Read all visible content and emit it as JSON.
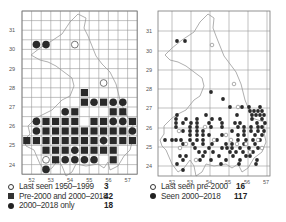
{
  "left_map": {
    "lat_labels": [
      "31",
      "30",
      "29",
      "28",
      "27",
      "26",
      "25",
      "24"
    ],
    "lon_labels": [
      "52",
      "53",
      "54",
      "55",
      "56",
      "57"
    ],
    "grid": {
      "x0": 22,
      "y0": 11,
      "cell": 9.6,
      "cols": 12,
      "rows": 17
    },
    "cells": {
      "square": [
        [
          6,
          8
        ],
        [
          6,
          9
        ],
        [
          8,
          9
        ],
        [
          5,
          10
        ],
        [
          9,
          10
        ],
        [
          10,
          10
        ],
        [
          2,
          11
        ],
        [
          3,
          11
        ],
        [
          4,
          11
        ],
        [
          5,
          11
        ],
        [
          7,
          11
        ],
        [
          8,
          11
        ],
        [
          11,
          11
        ],
        [
          2,
          12
        ],
        [
          3,
          12
        ],
        [
          4,
          12
        ],
        [
          5,
          12
        ],
        [
          6,
          12
        ],
        [
          7,
          12
        ],
        [
          8,
          12
        ],
        [
          9,
          12
        ],
        [
          10,
          12
        ],
        [
          0,
          13
        ],
        [
          1,
          13
        ],
        [
          2,
          13
        ],
        [
          3,
          13
        ],
        [
          4,
          13
        ],
        [
          5,
          13
        ],
        [
          6,
          13
        ],
        [
          7,
          13
        ],
        [
          9,
          13
        ],
        [
          10,
          13
        ],
        [
          11,
          13
        ],
        [
          2,
          14
        ],
        [
          3,
          14
        ],
        [
          4,
          14
        ],
        [
          6,
          14
        ],
        [
          7,
          14
        ],
        [
          8,
          14
        ],
        [
          9,
          14
        ],
        [
          3,
          15
        ],
        [
          9,
          15
        ]
      ],
      "dot": [
        [
          1,
          3
        ],
        [
          2,
          3
        ],
        [
          7,
          9
        ],
        [
          9,
          9
        ],
        [
          10,
          9
        ],
        [
          4,
          10
        ],
        [
          1,
          11
        ],
        [
          9,
          11
        ],
        [
          10,
          11
        ],
        [
          1,
          12
        ],
        [
          11,
          12
        ],
        [
          8,
          13
        ],
        [
          5,
          14
        ],
        [
          4,
          15
        ],
        [
          5,
          15
        ],
        [
          6,
          15
        ],
        [
          7,
          15
        ],
        [
          2,
          16
        ]
      ],
      "open": [
        [
          5,
          3
        ],
        [
          8,
          7
        ],
        [
          2,
          15
        ]
      ]
    },
    "legend": [
      {
        "symbol": "open-circle",
        "label": "Last seen 1950–1999",
        "count": "3"
      },
      {
        "symbol": "filled-square",
        "label": "Pre-2000 and 2000–2018",
        "count": "42"
      },
      {
        "symbol": "filled-circle",
        "label": "2000–2018 only",
        "count": "18"
      }
    ]
  },
  "right_map": {
    "lat_labels": [
      "31",
      "30",
      "29",
      "28",
      "27",
      "26",
      "25",
      "24"
    ],
    "lon_labels": [
      "52",
      "53",
      "54",
      "55",
      "56",
      "57"
    ],
    "filled_dots": [
      [
        177,
        41
      ],
      [
        185,
        41
      ],
      [
        211,
        92
      ],
      [
        223,
        99
      ],
      [
        230,
        107
      ],
      [
        242,
        107
      ],
      [
        249,
        107
      ],
      [
        260,
        107
      ],
      [
        250,
        111
      ],
      [
        254,
        111
      ],
      [
        258,
        111
      ],
      [
        262,
        111
      ],
      [
        177,
        115
      ],
      [
        206,
        115
      ],
      [
        237,
        115
      ],
      [
        252,
        115
      ],
      [
        256,
        115
      ],
      [
        260,
        115
      ],
      [
        264,
        115
      ],
      [
        176,
        119
      ],
      [
        186,
        119
      ],
      [
        197,
        119
      ],
      [
        212,
        119
      ],
      [
        220,
        119
      ],
      [
        252,
        119
      ],
      [
        262,
        119
      ],
      [
        176,
        123
      ],
      [
        183,
        123
      ],
      [
        191,
        123
      ],
      [
        197,
        123
      ],
      [
        209,
        123
      ],
      [
        222,
        123
      ],
      [
        235,
        123
      ],
      [
        240,
        123
      ],
      [
        257,
        123
      ],
      [
        265,
        123
      ],
      [
        176,
        127
      ],
      [
        190,
        127
      ],
      [
        197,
        127
      ],
      [
        211,
        127
      ],
      [
        222,
        127
      ],
      [
        238,
        127
      ],
      [
        244,
        127
      ],
      [
        251,
        127
      ],
      [
        258,
        127
      ],
      [
        262,
        127
      ],
      [
        183,
        131
      ],
      [
        190,
        131
      ],
      [
        197,
        131
      ],
      [
        203,
        131
      ],
      [
        232,
        131
      ],
      [
        244,
        131
      ],
      [
        251,
        131
      ],
      [
        258,
        131
      ],
      [
        264,
        131
      ],
      [
        190,
        135
      ],
      [
        197,
        135
      ],
      [
        203,
        135
      ],
      [
        209,
        135
      ],
      [
        222,
        135
      ],
      [
        238,
        135
      ],
      [
        244,
        135
      ],
      [
        255,
        135
      ],
      [
        262,
        135
      ],
      [
        165,
        140
      ],
      [
        172,
        140
      ],
      [
        176,
        140
      ],
      [
        181,
        140
      ],
      [
        190,
        140
      ],
      [
        197,
        140
      ],
      [
        203,
        140
      ],
      [
        217,
        140
      ],
      [
        238,
        140
      ],
      [
        246,
        140
      ],
      [
        253,
        140
      ],
      [
        260,
        140
      ],
      [
        183,
        144
      ],
      [
        193,
        144
      ],
      [
        203,
        144
      ],
      [
        212,
        144
      ],
      [
        226,
        144
      ],
      [
        232,
        144
      ],
      [
        244,
        144
      ],
      [
        255,
        144
      ],
      [
        195,
        148
      ],
      [
        209,
        148
      ],
      [
        222,
        148
      ],
      [
        227,
        148
      ],
      [
        232,
        148
      ],
      [
        240,
        148
      ],
      [
        249,
        148
      ],
      [
        258,
        148
      ],
      [
        199,
        152
      ],
      [
        205,
        152
      ],
      [
        213,
        152
      ],
      [
        230,
        152
      ],
      [
        236,
        152
      ],
      [
        243,
        152
      ],
      [
        253,
        152
      ],
      [
        180,
        156
      ],
      [
        186,
        156
      ],
      [
        203,
        156
      ],
      [
        219,
        156
      ],
      [
        233,
        156
      ],
      [
        246,
        156
      ],
      [
        250,
        156
      ],
      [
        183,
        160
      ],
      [
        200,
        160
      ],
      [
        211,
        160
      ],
      [
        226,
        160
      ],
      [
        240,
        160
      ],
      [
        257,
        160
      ],
      [
        177,
        164
      ],
      [
        221,
        164
      ],
      [
        239,
        164
      ],
      [
        256,
        164
      ],
      [
        183,
        170
      ]
    ],
    "open_dots": [
      [
        212,
        45
      ],
      [
        234,
        84
      ],
      [
        238,
        107
      ],
      [
        179,
        131
      ],
      [
        186,
        144
      ],
      [
        205,
        127
      ],
      [
        214,
        140
      ],
      [
        226,
        135
      ],
      [
        231,
        140
      ],
      [
        237,
        144
      ],
      [
        246,
        144
      ],
      [
        250,
        152
      ],
      [
        262,
        148
      ],
      [
        196,
        160
      ],
      [
        180,
        148
      ],
      [
        258,
        140
      ]
    ],
    "legend": [
      {
        "symbol": "open-circle",
        "label": "Last seen pre-2000",
        "count": "16"
      },
      {
        "symbol": "filled-circle",
        "label": "Seen 2000–2018",
        "count": "117"
      }
    ]
  },
  "colors": {
    "grid": "#999999",
    "frame": "#777777",
    "coast": "#9a9a9a",
    "symbol": "#2a2a2a"
  }
}
